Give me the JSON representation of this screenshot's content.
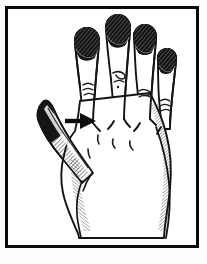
{
  "figure": {
    "style": "black-and-white pen-and-ink hatched line art",
    "caption": "",
    "frame": {
      "border_color": "#0a0a0a",
      "border_width_px": 3,
      "background_color": "#ffffff"
    },
    "colors": {
      "ink": "#111111",
      "outline": "#1a1a1a",
      "nail_fill": "#151515",
      "hatch": "#2b2b2b",
      "paper": "#ffffff",
      "page_background": "#fdfdfd"
    },
    "annotations": [
      {
        "id": "pointer-arrow",
        "type": "arrow",
        "direction": "right",
        "label": "",
        "points_to": "index-finger",
        "color": "#0d0d0d"
      }
    ],
    "anatomy": {
      "view": "dorsal",
      "side": "left",
      "digits": [
        {
          "id": "thumb",
          "name": "Thumb",
          "label": "",
          "shading": "heavy-hatched-dark"
        },
        {
          "id": "index-finger",
          "name": "Index finger",
          "label": "",
          "shading": "dark-nail"
        },
        {
          "id": "middle-finger",
          "name": "Middle finger",
          "label": "",
          "shading": "dark-nail"
        },
        {
          "id": "ring-finger",
          "name": "Ring finger",
          "label": "",
          "shading": "dark-nail"
        },
        {
          "id": "little-finger",
          "name": "Little finger",
          "label": "",
          "shading": "dark-nail"
        }
      ],
      "regions": [
        {
          "id": "dorsum",
          "name": "Dorsum of hand",
          "label": ""
        },
        {
          "id": "wrist",
          "name": "Wrist",
          "label": ""
        },
        {
          "id": "knuckles",
          "name": "Knuckles",
          "label": ""
        }
      ]
    }
  }
}
